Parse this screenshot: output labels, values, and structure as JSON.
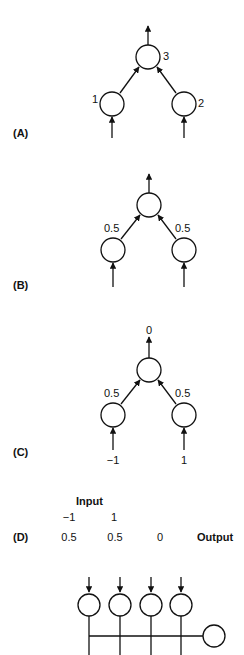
{
  "panels": {
    "A": {
      "label": "(A)",
      "node_labels": {
        "left": "1",
        "right": "2",
        "top": "3"
      }
    },
    "B": {
      "label": "(B)",
      "weights": {
        "left": "0.5",
        "right": "0.5"
      }
    },
    "C": {
      "label": "(C)",
      "weights": {
        "left": "0.5",
        "right": "0.5"
      },
      "inputs": {
        "left": "−1",
        "right": "1"
      },
      "output": "0"
    },
    "D": {
      "label": "(D)",
      "input_header": "Input",
      "inputs": [
        "−1",
        "1"
      ],
      "values": [
        "0.5",
        "0.5",
        "0"
      ],
      "output_header": "Output"
    }
  },
  "colors": {
    "stroke": "#111111",
    "background": "#ffffff"
  }
}
